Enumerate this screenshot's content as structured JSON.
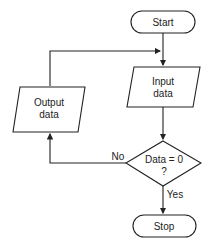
{
  "nodes": {
    "start": {
      "label": "Start"
    },
    "input": {
      "line1": "Input",
      "line2": "data"
    },
    "decision": {
      "line1": "Data = 0",
      "line2": "?"
    },
    "output": {
      "line1": "Output",
      "line2": "data"
    },
    "stop": {
      "label": "Stop"
    }
  },
  "edges": {
    "no_label": "No",
    "yes_label": "Yes"
  }
}
